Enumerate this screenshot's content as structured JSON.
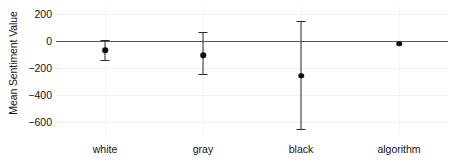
{
  "chart_data": {
    "type": "scatter",
    "title": "",
    "subtitle": "",
    "xlabel": "",
    "ylabel": "Mean Sentiment Value",
    "categories": [
      "white",
      "gray",
      "black",
      "algorithm"
    ],
    "values": [
      -65,
      -105,
      -255,
      -20
    ],
    "error_low": [
      -140,
      -245,
      -650,
      null
    ],
    "error_high": [
      10,
      70,
      150,
      null
    ],
    "series": [
      {
        "name": "Mean Sentiment Value",
        "points": [
          {
            "category": "white",
            "value": -65,
            "ci_low": -140,
            "ci_high": 10
          },
          {
            "category": "gray",
            "value": -105,
            "ci_low": -245,
            "ci_high": 70
          },
          {
            "category": "black",
            "value": -255,
            "ci_low": -650,
            "ci_high": 150
          },
          {
            "category": "algorithm",
            "value": -20,
            "ci_low": null,
            "ci_high": null
          }
        ]
      }
    ],
    "ylim": [
      -700,
      260
    ],
    "yticks": [
      200,
      0,
      -200,
      -400,
      -600
    ],
    "ytick_labels": [
      "200",
      "0",
      "−200",
      "−400",
      "−600"
    ],
    "gridlines": [
      200,
      -200,
      -400,
      -600
    ],
    "reference_line": 0,
    "grid": true,
    "legend": "none",
    "legend_position": "none",
    "colors": {
      "point": "#0d0d0d",
      "error_bar": "#2b2b2b",
      "zero_line": "#565656",
      "gridline": "#f0f0f0",
      "background": "#ffffff",
      "text": "#131313"
    }
  }
}
